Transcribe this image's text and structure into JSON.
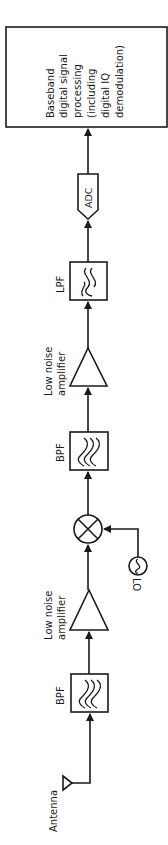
{
  "diagram": {
    "title": "",
    "orientation": "rotated-90",
    "blocks": [
      {
        "id": "antenna",
        "label": "Antenna"
      },
      {
        "id": "bpf1",
        "label": "BPF"
      },
      {
        "id": "lna1",
        "label_line1": "Low noise",
        "label_line2": "amplifier"
      },
      {
        "id": "mixer",
        "label": ""
      },
      {
        "id": "lo",
        "label": "LO"
      },
      {
        "id": "bpf2",
        "label": "BPF"
      },
      {
        "id": "lna2",
        "label_line1": "Low noise",
        "label_line2": "amplifier"
      },
      {
        "id": "lpf",
        "label": "LPF"
      },
      {
        "id": "adc",
        "label": "ADC"
      },
      {
        "id": "dsp",
        "lines": [
          "Baseband",
          "digital signal",
          "processing",
          "(including",
          "digital IQ",
          "demodulation)"
        ]
      }
    ],
    "connections": [
      [
        "antenna",
        "bpf1"
      ],
      [
        "bpf1",
        "lna1"
      ],
      [
        "lna1",
        "mixer"
      ],
      [
        "lo",
        "mixer"
      ],
      [
        "mixer",
        "bpf2"
      ],
      [
        "bpf2",
        "lna2"
      ],
      [
        "lna2",
        "lpf"
      ],
      [
        "lpf",
        "adc"
      ],
      [
        "adc",
        "dsp"
      ]
    ]
  }
}
